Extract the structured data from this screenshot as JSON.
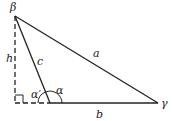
{
  "diagram": {
    "type": "triangle-obtuse-with-altitude",
    "colors": {
      "stroke": "#222222",
      "background": "#ffffff"
    },
    "vertices": {
      "beta": {
        "label": "β",
        "x": 15,
        "y": 14
      },
      "alpha": {
        "x": 50,
        "y": 103
      },
      "gamma": {
        "label": "γ",
        "x": 158,
        "y": 103
      },
      "foot": {
        "x": 15,
        "y": 103
      }
    },
    "sides": {
      "a": "a",
      "b": "b",
      "c": "c"
    },
    "altitude_label": "h",
    "angles": {
      "alpha": "α",
      "alpha_prime": "α′"
    }
  }
}
